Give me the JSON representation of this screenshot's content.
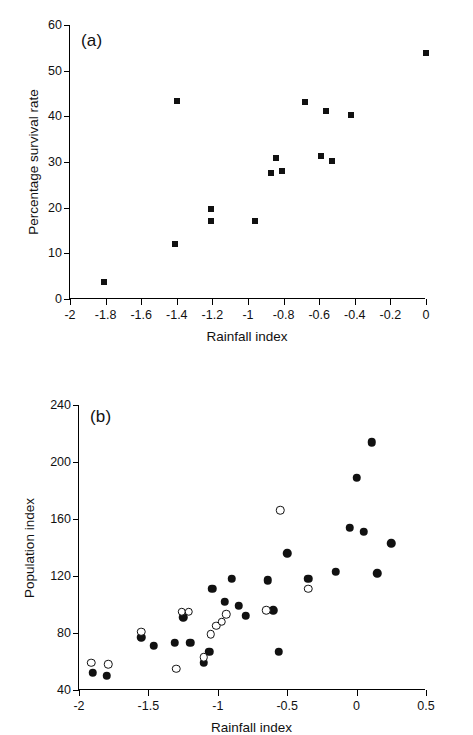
{
  "figure": {
    "background": "#ffffff",
    "ink": "#111111"
  },
  "chart_data": [
    {
      "type": "scatter",
      "panel": "a",
      "panel_label": "(a)",
      "title": "",
      "xlabel": "Rainfall index",
      "ylabel": "Percentage survival rate",
      "xlim": [
        -2,
        0
      ],
      "ylim": [
        0,
        60
      ],
      "xticks": [
        -2,
        -1.8,
        -1.6,
        -1.4,
        -1.2,
        -1,
        -0.8,
        -0.6,
        -0.4,
        -0.2,
        0
      ],
      "xticklabels": [
        "-2",
        "-1.8",
        "-1.6",
        "-1.4",
        "-1.2",
        "-1",
        "-0.8",
        "-0.6",
        "-0.4",
        "-0.2",
        "0"
      ],
      "yticks": [
        0,
        10,
        20,
        30,
        40,
        50,
        60
      ],
      "yticklabels": [
        "0",
        "10",
        "20",
        "30",
        "40",
        "50",
        "60"
      ],
      "grid": false,
      "legend": "none",
      "series": [
        {
          "name": "Percentage survival rate",
          "marker": "filled-square",
          "color": "#111111",
          "points": [
            {
              "x": -1.81,
              "y": 3.8
            },
            {
              "x": -1.41,
              "y": 12.0
            },
            {
              "x": -1.4,
              "y": 43.4
            },
            {
              "x": -1.21,
              "y": 19.7
            },
            {
              "x": -1.21,
              "y": 17.1
            },
            {
              "x": -0.96,
              "y": 17.1
            },
            {
              "x": -0.87,
              "y": 27.6
            },
            {
              "x": -0.84,
              "y": 30.9
            },
            {
              "x": -0.81,
              "y": 28.1
            },
            {
              "x": -0.68,
              "y": 43.1
            },
            {
              "x": -0.59,
              "y": 31.3
            },
            {
              "x": -0.56,
              "y": 41.2
            },
            {
              "x": -0.53,
              "y": 30.2
            },
            {
              "x": -0.42,
              "y": 40.3
            },
            {
              "x": 0.0,
              "y": 53.8
            }
          ]
        }
      ]
    },
    {
      "type": "scatter",
      "panel": "b",
      "panel_label": "(b)",
      "title": "",
      "xlabel": "Rainfall index",
      "ylabel": "Population index",
      "xlim": [
        -2,
        0.5
      ],
      "ylim": [
        40,
        240
      ],
      "xticks": [
        -2,
        -1.5,
        -1,
        -0.5,
        0,
        0.5
      ],
      "xticklabels": [
        "-2",
        "-1.5",
        "-1",
        "-0.5",
        "0",
        "0.5"
      ],
      "yticks": [
        40,
        80,
        120,
        160,
        200,
        240
      ],
      "yticklabels": [
        "40",
        "80",
        "120",
        "160",
        "200",
        "240"
      ],
      "grid": false,
      "legend": "none",
      "series": [
        {
          "name": "Filled symbols",
          "marker": "filled-circle",
          "color": "#111111",
          "points": [
            {
              "x": -1.9,
              "y": 52
            },
            {
              "x": -1.8,
              "y": 50
            },
            {
              "x": -1.55,
              "y": 77
            },
            {
              "x": -1.46,
              "y": 71
            },
            {
              "x": -1.31,
              "y": 73
            },
            {
              "x": -1.25,
              "y": 91
            },
            {
              "x": -1.2,
              "y": 73
            },
            {
              "x": -1.1,
              "y": 59
            },
            {
              "x": -1.06,
              "y": 67
            },
            {
              "x": -1.04,
              "y": 111
            },
            {
              "x": -0.95,
              "y": 102
            },
            {
              "x": -0.9,
              "y": 118
            },
            {
              "x": -0.85,
              "y": 99
            },
            {
              "x": -0.8,
              "y": 92
            },
            {
              "x": -0.64,
              "y": 117
            },
            {
              "x": -0.6,
              "y": 96
            },
            {
              "x": -0.56,
              "y": 67
            },
            {
              "x": -0.5,
              "y": 136
            },
            {
              "x": -0.35,
              "y": 118
            },
            {
              "x": -0.15,
              "y": 123
            },
            {
              "x": -0.05,
              "y": 154
            },
            {
              "x": 0.0,
              "y": 189
            },
            {
              "x": 0.05,
              "y": 151
            },
            {
              "x": 0.11,
              "y": 214
            },
            {
              "x": 0.15,
              "y": 122
            },
            {
              "x": 0.25,
              "y": 143
            }
          ]
        },
        {
          "name": "Open symbols",
          "marker": "open-circle",
          "color": "#111111",
          "points": [
            {
              "x": -1.91,
              "y": 59
            },
            {
              "x": -1.79,
              "y": 58
            },
            {
              "x": -1.55,
              "y": 81
            },
            {
              "x": -1.3,
              "y": 55
            },
            {
              "x": -1.26,
              "y": 95
            },
            {
              "x": -1.21,
              "y": 95
            },
            {
              "x": -1.1,
              "y": 63
            },
            {
              "x": -1.05,
              "y": 79
            },
            {
              "x": -1.01,
              "y": 85
            },
            {
              "x": -0.97,
              "y": 88
            },
            {
              "x": -0.94,
              "y": 93
            },
            {
              "x": -0.65,
              "y": 96
            },
            {
              "x": -0.55,
              "y": 166
            },
            {
              "x": -0.35,
              "y": 111
            }
          ]
        }
      ]
    }
  ]
}
